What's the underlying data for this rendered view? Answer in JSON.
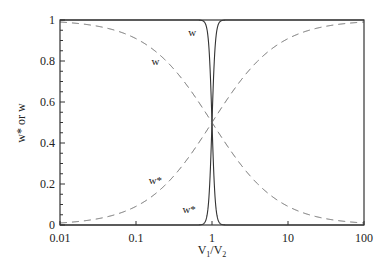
{
  "chart_data": {
    "type": "line",
    "title": "",
    "xlabel": "V1/V2",
    "ylabel": "w* or w",
    "xscale": "log",
    "xlim": [
      0.01,
      100
    ],
    "ylim": [
      0,
      1
    ],
    "grid": false,
    "legend": "none (inline curve labels)",
    "x_ticks": [
      0.01,
      0.1,
      1,
      10,
      100
    ],
    "x_tick_labels": [
      "0.01",
      "0.1",
      "1",
      "10",
      "100"
    ],
    "y_ticks": [
      0,
      0.2,
      0.4,
      0.6,
      0.8,
      1
    ],
    "y_tick_labels": [
      "0",
      "0.2",
      "0.4",
      "0.6",
      "0.8",
      "1"
    ],
    "series": [
      {
        "name": "w (solid, steep)",
        "style": "solid",
        "formula": "1/(1+r^20)",
        "x": [
          0.01,
          0.1,
          0.5,
          0.8,
          0.9,
          0.95,
          1,
          1.05,
          1.1,
          1.25,
          2,
          10,
          100
        ],
        "values": [
          1.0,
          1.0,
          1.0,
          0.99,
          0.89,
          0.74,
          0.5,
          0.27,
          0.13,
          0.01,
          0.0,
          0.0,
          0.0
        ]
      },
      {
        "name": "w* (solid, steep)",
        "style": "solid",
        "formula": "r^20/(1+r^20)",
        "x": [
          0.01,
          0.1,
          0.5,
          0.8,
          0.9,
          0.95,
          1,
          1.05,
          1.1,
          1.25,
          2,
          10,
          100
        ],
        "values": [
          0.0,
          0.0,
          0.0,
          0.01,
          0.11,
          0.26,
          0.5,
          0.73,
          0.87,
          0.99,
          1.0,
          1.0,
          1.0
        ]
      },
      {
        "name": "w (dashed)",
        "style": "dashed",
        "formula": "1/(1+r)",
        "x": [
          0.01,
          0.1,
          0.3,
          1,
          3,
          10,
          100
        ],
        "values": [
          0.99,
          0.91,
          0.77,
          0.5,
          0.25,
          0.09,
          0.01
        ]
      },
      {
        "name": "w* (dashed)",
        "style": "dashed",
        "formula": "r/(1+r)",
        "x": [
          0.01,
          0.1,
          0.3,
          1,
          3,
          10,
          100
        ],
        "values": [
          0.01,
          0.09,
          0.23,
          0.5,
          0.75,
          0.91,
          0.99
        ]
      }
    ],
    "annotations": [
      {
        "text": "w",
        "x": 0.55,
        "y": 0.94
      },
      {
        "text": "w",
        "x": 0.18,
        "y": 0.8
      },
      {
        "text": "w*",
        "x": 0.18,
        "y": 0.22
      },
      {
        "text": "w*",
        "x": 0.5,
        "y": 0.08
      }
    ]
  },
  "labels": {
    "x_axis_title_main": "V",
    "x_axis_sub1": "1",
    "x_axis_slash": "/V",
    "x_axis_sub2": "2",
    "y_axis_title": "w* or w"
  },
  "style": {
    "axis_color": "#333333",
    "solid_color": "#333333",
    "dashed_color": "#666666",
    "steepness_n": 20
  }
}
